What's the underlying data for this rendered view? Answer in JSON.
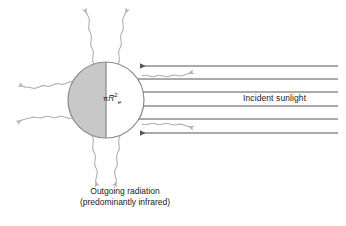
{
  "figure": {
    "background_color": "#ffffff",
    "width": 346,
    "height": 226
  },
  "labels": {
    "cross_section": {
      "pi": "π",
      "radius_symbol": "R",
      "exponent": "2",
      "subscript": "e",
      "full_text": "πR²e"
    },
    "incident_sunlight": "Incident sunlight",
    "outgoing_radiation_line1": "Outgoing radiation",
    "outgoing_radiation_line2": "(predominantly infrared)"
  },
  "colors": {
    "shaded_hemisphere": "#c8c8c8",
    "lit_hemisphere": "#ffffff",
    "circle_outline": "#8a8a8a",
    "ray_line": "#555555",
    "wavy_line": "#b0b0b0",
    "text": "#1a1a1a"
  },
  "earth": {
    "center_x": 106,
    "center_y": 100,
    "radius": 38,
    "shaded_side": "left",
    "lit_side": "right",
    "terminator_line_x": 106
  },
  "incident_rays": {
    "count": 6,
    "direction": "right-to-left",
    "right_edge_x": 338,
    "rays": [
      {
        "y": 66,
        "tip_x": 140
      },
      {
        "y": 79,
        "tip_x": 132
      },
      {
        "y": 92,
        "tip_x": 128
      },
      {
        "y": 106,
        "tip_x": 128
      },
      {
        "y": 119,
        "tip_x": 132
      },
      {
        "y": 133,
        "tip_x": 140
      }
    ]
  },
  "outgoing_waves": {
    "count": 8,
    "description": "wavy arrows radiating outward from the globe",
    "arrows": [
      {
        "angle_deg": 108,
        "from_x": 94,
        "from_y": 64,
        "to_x": 78,
        "to_y": 12
      },
      {
        "angle_deg": 72,
        "from_x": 118,
        "from_y": 64,
        "to_x": 136,
        "to_y": 12
      },
      {
        "angle_deg": 150,
        "from_x": 74,
        "from_y": 82,
        "to_x": 20,
        "to_y": 62
      },
      {
        "angle_deg": 198,
        "from_x": 72,
        "from_y": 118,
        "to_x": 16,
        "to_y": 134
      },
      {
        "angle_deg": 250,
        "from_x": 92,
        "from_y": 136,
        "to_x": 78,
        "to_y": 184
      },
      {
        "angle_deg": 290,
        "from_x": 120,
        "from_y": 136,
        "to_x": 136,
        "to_y": 184
      },
      {
        "angle_deg": 30,
        "from_x": 140,
        "from_y": 76,
        "to_x": 196,
        "to_y": 68
      },
      {
        "angle_deg": 330,
        "from_x": 140,
        "from_y": 124,
        "to_x": 196,
        "to_y": 132
      }
    ]
  }
}
